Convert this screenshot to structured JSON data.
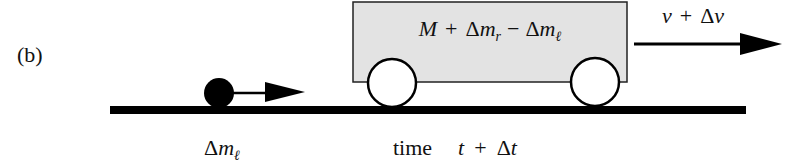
{
  "figure": {
    "panel_label": "(b)",
    "cart_label": {
      "M": "M",
      "plus": "+",
      "delta_r": "Δ",
      "m_r": "m",
      "sub_r": "r",
      "minus": "−",
      "delta_l": "Δ",
      "m_l": "m",
      "sub_l": "ℓ"
    },
    "velocity_label": {
      "v": "v",
      "plus": "+",
      "delta": "Δ",
      "dv": "v"
    },
    "mass_label": {
      "delta": "Δ",
      "m": "m",
      "sub": "ℓ"
    },
    "time_label": {
      "word": "time",
      "t": "t",
      "plus": "+",
      "delta": "Δ",
      "dt": "t"
    },
    "colors": {
      "cart_fill": "#e3e3e3",
      "ink": "#000000",
      "wheel_fill": "#ffffff"
    }
  }
}
